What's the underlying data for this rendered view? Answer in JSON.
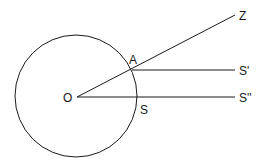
{
  "diagram": {
    "circle": {
      "cx": 76,
      "cy": 96,
      "r": 61
    },
    "points": {
      "O": {
        "label": "O",
        "x": 77,
        "y": 97
      },
      "A": {
        "label": "A",
        "x": 132,
        "y": 69
      },
      "S": {
        "label": "S",
        "x": 137,
        "y": 97
      },
      "Z": {
        "label": "Z",
        "x": 235,
        "y": 15
      },
      "S_prime": {
        "label": "S'",
        "x": 235,
        "y": 70
      },
      "S_double_prime": {
        "label": "S''",
        "x": 235,
        "y": 97
      }
    },
    "lines": [
      {
        "from": "O",
        "to": "Z"
      },
      {
        "from": "A",
        "to": "S_prime"
      },
      {
        "from": "O",
        "to": "S_double_prime"
      }
    ]
  }
}
